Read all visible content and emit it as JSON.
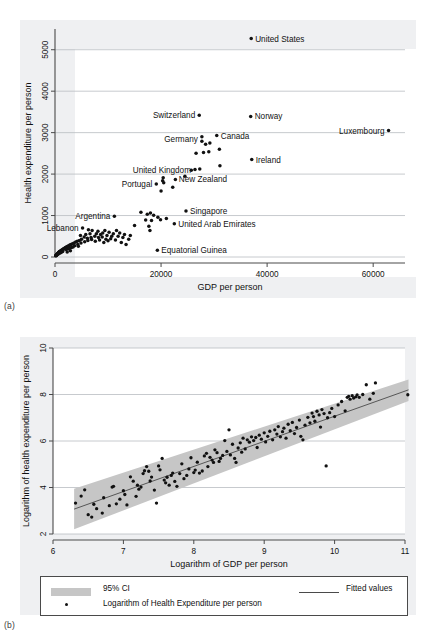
{
  "figure": {
    "caption_a": "(a)",
    "caption_b": "(b)"
  },
  "chart_data": [
    {
      "id": "panel-a",
      "type": "scatter",
      "title": "",
      "xlabel": "GDP per person",
      "ylabel": "Health expenditure per person",
      "xlim": [
        0,
        66000
      ],
      "ylim": [
        0,
        5500
      ],
      "xticks": [
        0,
        20000,
        40000,
        60000
      ],
      "xticklabels": [
        "0",
        "20000",
        "40000",
        "60000"
      ],
      "yticks": [
        0,
        1000,
        2000,
        3000,
        4000,
        5000
      ],
      "yticklabels": [
        "0",
        "1000",
        "2000",
        "3000",
        "4000",
        "5000"
      ],
      "grid": "horizontal",
      "legend": "none",
      "annotations": [
        {
          "label": "United States",
          "x": 37000,
          "y": 5270,
          "side": "right"
        },
        {
          "label": "Switzerland",
          "x": 27200,
          "y": 3420,
          "side": "left"
        },
        {
          "label": "Norway",
          "x": 36900,
          "y": 3390,
          "side": "right"
        },
        {
          "label": "Luxembourg",
          "x": 62900,
          "y": 3050,
          "side": "left"
        },
        {
          "label": "Canada",
          "x": 30500,
          "y": 2930,
          "side": "right"
        },
        {
          "label": "Germany",
          "x": 27700,
          "y": 2840,
          "side": "left"
        },
        {
          "label": "Ireland",
          "x": 37100,
          "y": 2350,
          "side": "right"
        },
        {
          "label": "United Kingdom",
          "x": 26400,
          "y": 2110,
          "side": "left"
        },
        {
          "label": "New Zealand",
          "x": 22600,
          "y": 1870,
          "side": "right"
        },
        {
          "label": "Portugal",
          "x": 19100,
          "y": 1760,
          "side": "left"
        },
        {
          "label": "Singapore",
          "x": 24700,
          "y": 1110,
          "side": "right"
        },
        {
          "label": "Argentina",
          "x": 11200,
          "y": 980,
          "side": "left"
        },
        {
          "label": "United Arab Emirates",
          "x": 22500,
          "y": 800,
          "side": "right"
        },
        {
          "label": "Lebanon",
          "x": 5200,
          "y": 700,
          "side": "left"
        },
        {
          "label": "Equatorial Guinea",
          "x": 19300,
          "y": 160,
          "side": "right"
        }
      ],
      "points": [
        [
          37000,
          5270
        ],
        [
          27200,
          3420
        ],
        [
          36900,
          3390
        ],
        [
          62900,
          3050
        ],
        [
          30500,
          2930
        ],
        [
          27700,
          2900
        ],
        [
          27700,
          2790
        ],
        [
          29200,
          2750
        ],
        [
          28400,
          2720
        ],
        [
          31000,
          2600
        ],
        [
          26600,
          2500
        ],
        [
          28000,
          2520
        ],
        [
          29000,
          2540
        ],
        [
          37100,
          2350
        ],
        [
          31100,
          2200
        ],
        [
          26400,
          2110
        ],
        [
          27300,
          2120
        ],
        [
          25700,
          2090
        ],
        [
          24500,
          1950
        ],
        [
          20400,
          1910
        ],
        [
          20300,
          1840
        ],
        [
          22700,
          1870
        ],
        [
          20500,
          1790
        ],
        [
          19100,
          1760
        ],
        [
          22200,
          1680
        ],
        [
          20000,
          1590
        ],
        [
          16200,
          1080
        ],
        [
          17400,
          1030
        ],
        [
          18000,
          1060
        ],
        [
          18600,
          1010
        ],
        [
          19400,
          960
        ],
        [
          24700,
          1110
        ],
        [
          19900,
          900
        ],
        [
          21000,
          930
        ],
        [
          18200,
          880
        ],
        [
          17100,
          890
        ],
        [
          11200,
          980
        ],
        [
          22500,
          800
        ],
        [
          17700,
          740
        ],
        [
          17900,
          640
        ],
        [
          19300,
          160
        ],
        [
          5200,
          700
        ],
        [
          6300,
          660
        ],
        [
          7000,
          640
        ],
        [
          8100,
          620
        ],
        [
          9000,
          580
        ],
        [
          9400,
          640
        ],
        [
          10200,
          600
        ],
        [
          11000,
          560
        ],
        [
          11600,
          640
        ],
        [
          12200,
          580
        ],
        [
          13100,
          540
        ],
        [
          13900,
          430
        ],
        [
          12800,
          470
        ],
        [
          11900,
          500
        ],
        [
          10700,
          500
        ],
        [
          9800,
          520
        ],
        [
          8900,
          480
        ],
        [
          8200,
          470
        ],
        [
          7500,
          500
        ],
        [
          6800,
          470
        ],
        [
          6100,
          450
        ],
        [
          5500,
          480
        ],
        [
          5000,
          430
        ],
        [
          4600,
          400
        ],
        [
          4200,
          380
        ],
        [
          3900,
          360
        ],
        [
          3600,
          340
        ],
        [
          3300,
          320
        ],
        [
          3000,
          300
        ],
        [
          2800,
          290
        ],
        [
          2600,
          270
        ],
        [
          2400,
          260
        ],
        [
          2200,
          250
        ],
        [
          2000,
          230
        ],
        [
          1900,
          220
        ],
        [
          1800,
          210
        ],
        [
          1700,
          200
        ],
        [
          1600,
          190
        ],
        [
          1500,
          185
        ],
        [
          1400,
          175
        ],
        [
          1300,
          165
        ],
        [
          1200,
          160
        ],
        [
          1100,
          150
        ],
        [
          1000,
          140
        ],
        [
          950,
          135
        ],
        [
          900,
          130
        ],
        [
          850,
          125
        ],
        [
          800,
          118
        ],
        [
          760,
          112
        ],
        [
          720,
          108
        ],
        [
          690,
          102
        ],
        [
          650,
          98
        ],
        [
          610,
          92
        ],
        [
          580,
          88
        ],
        [
          550,
          84
        ],
        [
          520,
          80
        ],
        [
          490,
          76
        ],
        [
          460,
          72
        ],
        [
          430,
          68
        ],
        [
          400,
          64
        ],
        [
          370,
          60
        ],
        [
          340,
          56
        ],
        [
          310,
          52
        ],
        [
          280,
          48
        ],
        [
          250,
          44
        ],
        [
          220,
          40
        ],
        [
          200,
          36
        ],
        [
          180,
          32
        ],
        [
          160,
          28
        ],
        [
          2500,
          200
        ],
        [
          3100,
          230
        ],
        [
          3700,
          270
        ],
        [
          4300,
          300
        ],
        [
          4900,
          340
        ],
        [
          5600,
          370
        ],
        [
          6200,
          400
        ],
        [
          6900,
          420
        ],
        [
          7600,
          380
        ],
        [
          8400,
          410
        ],
        [
          9200,
          350
        ],
        [
          10000,
          390
        ],
        [
          4400,
          260
        ],
        [
          3400,
          240
        ],
        [
          2700,
          210
        ],
        [
          2100,
          180
        ],
        [
          1450,
          130
        ],
        [
          1150,
          110
        ],
        [
          870,
          90
        ],
        [
          630,
          70
        ],
        [
          14200,
          520
        ],
        [
          12500,
          350
        ],
        [
          13400,
          300
        ],
        [
          15000,
          760
        ],
        [
          6600,
          560
        ],
        [
          7800,
          560
        ],
        [
          8600,
          540
        ],
        [
          5800,
          540
        ],
        [
          4800,
          520
        ],
        [
          10500,
          440
        ],
        [
          9600,
          430
        ],
        [
          11400,
          410
        ],
        [
          2900,
          150
        ],
        [
          2300,
          120
        ]
      ]
    },
    {
      "id": "panel-b",
      "type": "scatter",
      "title": "",
      "xlabel": "Logarithm of GDP per person",
      "ylabel": "Logarithm of health expenditure per person",
      "xlim": [
        6,
        11
      ],
      "ylim": [
        2,
        10
      ],
      "xticks": [
        6,
        7,
        8,
        9,
        10,
        11
      ],
      "xticklabels": [
        "6",
        "7",
        "8",
        "9",
        "10",
        "11"
      ],
      "yticks": [
        2,
        4,
        6,
        8,
        10
      ],
      "yticklabels": [
        "2",
        "4",
        "6",
        "8",
        "10"
      ],
      "grid": "horizontal",
      "fit_line": {
        "x0": 6.3,
        "y0": 3.07,
        "x1": 11.05,
        "y1": 8.2
      },
      "ci_band": {
        "x0": 6.3,
        "x1": 11.05,
        "upper0": 3.95,
        "upper1": 8.65,
        "lower0": 2.2,
        "lower1": 7.72
      },
      "legend": {
        "position": "below",
        "entries": [
          {
            "key": "ci",
            "label": "95% CI"
          },
          {
            "key": "fit",
            "label": "Fitted values"
          },
          {
            "key": "points",
            "label": "Logarithm of Health Expenditure per person"
          }
        ]
      },
      "points": [
        [
          6.32,
          3.33
        ],
        [
          6.4,
          3.63
        ],
        [
          6.45,
          3.9
        ],
        [
          6.5,
          2.83
        ],
        [
          6.55,
          2.73
        ],
        [
          6.58,
          3.28
        ],
        [
          6.62,
          3.09
        ],
        [
          6.7,
          2.9
        ],
        [
          6.72,
          3.56
        ],
        [
          6.8,
          3.22
        ],
        [
          6.84,
          4.02
        ],
        [
          6.86,
          4.05
        ],
        [
          6.9,
          3.3
        ],
        [
          6.95,
          3.5
        ],
        [
          7.0,
          3.86
        ],
        [
          7.02,
          3.7
        ],
        [
          7.05,
          3.25
        ],
        [
          7.1,
          4.46
        ],
        [
          7.14,
          4.27
        ],
        [
          7.18,
          3.62
        ],
        [
          7.2,
          4.1
        ],
        [
          7.22,
          3.93
        ],
        [
          7.25,
          4.02
        ],
        [
          7.28,
          4.6
        ],
        [
          7.3,
          4.72
        ],
        [
          7.33,
          4.9
        ],
        [
          7.36,
          4.7
        ],
        [
          7.38,
          4.28
        ],
        [
          7.4,
          4.45
        ],
        [
          7.44,
          3.89
        ],
        [
          7.47,
          3.33
        ],
        [
          7.5,
          4.93
        ],
        [
          7.52,
          4.76
        ],
        [
          7.55,
          5.25
        ],
        [
          7.58,
          4.32
        ],
        [
          7.6,
          4.2
        ],
        [
          7.62,
          4.44
        ],
        [
          7.65,
          4.1
        ],
        [
          7.68,
          4.52
        ],
        [
          7.7,
          4.62
        ],
        [
          7.73,
          4.26
        ],
        [
          7.76,
          4.05
        ],
        [
          7.8,
          4.6
        ],
        [
          7.83,
          5.02
        ],
        [
          7.86,
          4.38
        ],
        [
          7.9,
          4.52
        ],
        [
          7.93,
          4.8
        ],
        [
          7.96,
          5.28
        ],
        [
          8.0,
          4.64
        ],
        [
          8.02,
          4.75
        ],
        [
          8.05,
          5.09
        ],
        [
          8.08,
          4.62
        ],
        [
          8.12,
          4.71
        ],
        [
          8.15,
          5.36
        ],
        [
          8.18,
          5.47
        ],
        [
          8.2,
          4.9
        ],
        [
          8.23,
          5.3
        ],
        [
          8.26,
          5.18
        ],
        [
          8.28,
          5.08
        ],
        [
          8.3,
          5.62
        ],
        [
          8.33,
          5.5
        ],
        [
          8.36,
          5.12
        ],
        [
          8.38,
          5.25
        ],
        [
          8.41,
          5.38
        ],
        [
          8.44,
          6.02
        ],
        [
          8.47,
          5.55
        ],
        [
          8.5,
          6.48
        ],
        [
          8.52,
          5.4
        ],
        [
          8.55,
          5.86
        ],
        [
          8.58,
          5.25
        ],
        [
          8.6,
          5.08
        ],
        [
          8.63,
          5.7
        ],
        [
          8.66,
          5.92
        ],
        [
          8.68,
          5.52
        ],
        [
          8.7,
          6.12
        ],
        [
          8.73,
          5.66
        ],
        [
          8.76,
          6.05
        ],
        [
          8.79,
          5.95
        ],
        [
          8.82,
          6.18
        ],
        [
          8.85,
          6.02
        ],
        [
          8.88,
          6.15
        ],
        [
          8.9,
          5.72
        ],
        [
          8.93,
          6.25
        ],
        [
          8.96,
          6.08
        ],
        [
          9.0,
          6.35
        ],
        [
          9.02,
          5.96
        ],
        [
          9.05,
          6.2
        ],
        [
          9.08,
          6.42
        ],
        [
          9.12,
          6.05
        ],
        [
          9.15,
          6.48
        ],
        [
          9.18,
          6.3
        ],
        [
          9.2,
          6.62
        ],
        [
          9.23,
          6.18
        ],
        [
          9.26,
          6.4
        ],
        [
          9.28,
          6.55
        ],
        [
          9.31,
          6.12
        ],
        [
          9.34,
          6.72
        ],
        [
          9.37,
          6.44
        ],
        [
          9.4,
          6.8
        ],
        [
          9.43,
          6.32
        ],
        [
          9.46,
          6.58
        ],
        [
          9.5,
          6.9
        ],
        [
          9.52,
          6.2
        ],
        [
          9.55,
          6.05
        ],
        [
          9.58,
          6.68
        ],
        [
          9.62,
          7.02
        ],
        [
          9.65,
          6.78
        ],
        [
          9.68,
          7.2
        ],
        [
          9.7,
          7.05
        ],
        [
          9.72,
          6.85
        ],
        [
          9.75,
          7.28
        ],
        [
          9.78,
          7.12
        ],
        [
          9.8,
          6.6
        ],
        [
          9.82,
          7.35
        ],
        [
          9.85,
          7.18
        ],
        [
          9.88,
          4.93
        ],
        [
          9.9,
          7.0
        ],
        [
          9.93,
          7.22
        ],
        [
          9.96,
          7.4
        ],
        [
          10.0,
          7.05
        ],
        [
          10.05,
          7.55
        ],
        [
          10.1,
          7.7
        ],
        [
          10.15,
          7.3
        ],
        [
          10.18,
          7.88
        ],
        [
          10.2,
          7.92
        ],
        [
          10.22,
          7.8
        ],
        [
          10.25,
          7.95
        ],
        [
          10.27,
          7.85
        ],
        [
          10.3,
          7.9
        ],
        [
          10.32,
          7.98
        ],
        [
          10.35,
          7.88
        ],
        [
          10.4,
          8.0
        ],
        [
          10.45,
          8.42
        ],
        [
          10.5,
          7.8
        ],
        [
          10.55,
          8.05
        ],
        [
          10.58,
          8.5
        ],
        [
          11.04,
          7.99
        ]
      ]
    }
  ]
}
